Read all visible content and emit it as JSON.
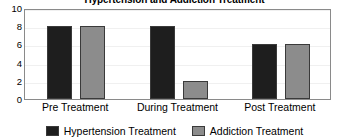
{
  "chart_data": {
    "type": "bar",
    "title": "Hypertension and Addiction Treatment",
    "xlabel": "",
    "ylabel": "",
    "categories": [
      "Pre Treatment",
      "During Treatment",
      "Post Treatment"
    ],
    "series": [
      {
        "name": "Hypertension Treatment",
        "color": "#1e1e1e",
        "values": [
          8,
          8,
          6
        ]
      },
      {
        "name": "Addiction Treatment",
        "color": "#8c8c8c",
        "values": [
          8,
          2,
          6
        ]
      }
    ],
    "ylim": [
      0,
      10
    ],
    "yticks": [
      0,
      2,
      4,
      6,
      8,
      10
    ],
    "ytick_labels": [
      "0",
      "2",
      "4",
      "6",
      "8",
      "10"
    ],
    "grid": true,
    "legend_position": "bottom"
  },
  "legend": {
    "entries": [
      {
        "label": "Hypertension Treatment",
        "color": "#1e1e1e"
      },
      {
        "label": "Addiction Treatment",
        "color": "#8c8c8c"
      }
    ]
  },
  "colors": {
    "hypertension": "#1e1e1e",
    "addiction": "#8c8c8c",
    "frame": "#8a8a8a",
    "gridline": "#f0f0f0",
    "bar_outline": "#3a3a3a",
    "text": "#000000",
    "background": "#ffffff"
  }
}
